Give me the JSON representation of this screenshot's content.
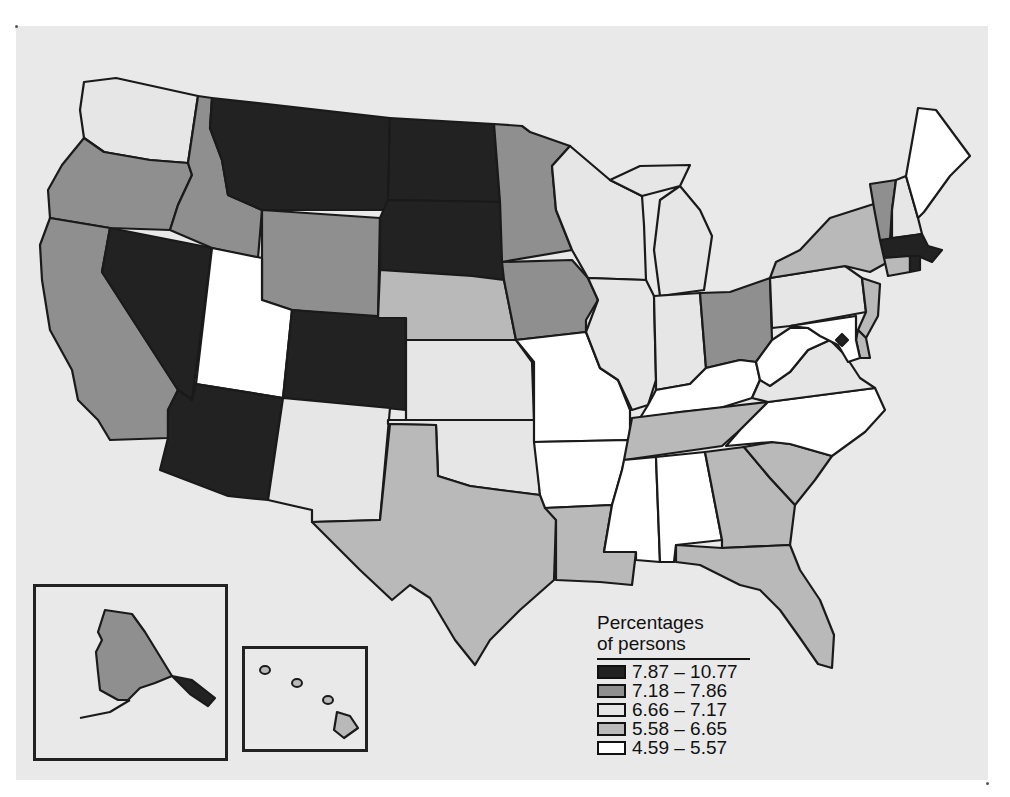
{
  "map": {
    "type": "choropleth",
    "region": "United States",
    "legend": {
      "title_line1": "Percentages",
      "title_line2": "of persons",
      "classes": [
        {
          "label": "7.87 – 10.77",
          "color": "#222222"
        },
        {
          "label": "7.18 – 7.86",
          "color": "#8f8f8f"
        },
        {
          "label": "6.66 – 7.17",
          "color": "#e6e6e6"
        },
        {
          "label": "5.58 – 6.65",
          "color": "#b9b9b9"
        },
        {
          "label": "4.59 – 5.57",
          "color": "#ffffff"
        }
      ]
    },
    "states": {
      "WA": "6.66 – 7.17",
      "OR": "7.18 – 7.86",
      "CA": "7.18 – 7.86",
      "ID": "7.18 – 7.86",
      "NV": "7.87 – 10.77",
      "MT": "7.87 – 10.77",
      "WY": "7.18 – 7.86",
      "UT": "4.59 – 5.57",
      "AZ": "7.87 – 10.77",
      "CO": "7.87 – 10.77",
      "NM": "6.66 – 7.17",
      "ND": "7.87 – 10.77",
      "SD": "7.87 – 10.77",
      "NE": "5.58 – 6.65",
      "KS": "6.66 – 7.17",
      "OK": "6.66 – 7.17",
      "TX": "5.58 – 6.65",
      "MN": "7.18 – 7.86",
      "IA": "7.18 – 7.86",
      "MO": "4.59 – 5.57",
      "AR": "4.59 – 5.57",
      "LA": "5.58 – 6.65",
      "WI": "6.66 – 7.17",
      "IL": "6.66 – 7.17",
      "MI": "6.66 – 7.17",
      "IN": "6.66 – 7.17",
      "OH": "7.18 – 7.86",
      "KY": "4.59 – 5.57",
      "TN": "5.58 – 6.65",
      "MS": "4.59 – 5.57",
      "AL": "4.59 – 5.57",
      "GA": "5.58 – 6.65",
      "FL": "5.58 – 6.65",
      "SC": "5.58 – 6.65",
      "NC": "4.59 – 5.57",
      "VA": "6.66 – 7.17",
      "WV": "4.59 – 5.57",
      "PA": "6.66 – 7.17",
      "NY": "5.58 – 6.65",
      "NJ": "5.58 – 6.65",
      "DE": "5.58 – 6.65",
      "MD": "4.59 – 5.57",
      "DC": "7.87 – 10.77",
      "VT": "7.18 – 7.86",
      "NH": "6.66 – 7.17",
      "ME": "4.59 – 5.57",
      "MA": "7.87 – 10.77",
      "RI": "7.87 – 10.77",
      "CT": "5.58 – 6.65",
      "AK": "7.18 – 7.86",
      "HI": "5.58 – 6.65"
    },
    "colors": {
      "background": "#ffffff",
      "panel": "#e9e9e9",
      "border": "#1a1a1a"
    }
  }
}
